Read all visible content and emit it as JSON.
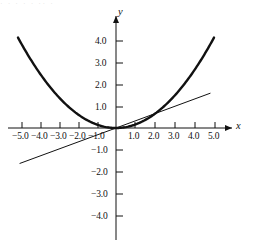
{
  "figure": {
    "background_color": "#ffffff",
    "stroke_color": "#111111",
    "top_artifact_text": "· ·   · ·  ·   ·· ·"
  },
  "chart_data": {
    "type": "line",
    "title": "",
    "subtitle": "",
    "xlabel": "x",
    "ylabel": "y",
    "xlim": [
      -5.6,
      5.9
    ],
    "ylim": [
      -4.8,
      4.6
    ],
    "grid": false,
    "legend": null,
    "axes_style": "cartesian-cross",
    "x_ticks": [
      -5,
      -4,
      -3,
      -2,
      -1,
      1,
      2,
      3,
      4,
      5
    ],
    "x_tick_labels": [
      "−5.0",
      "−4.0",
      "−3.0",
      "−2.0",
      "−1.0",
      "1.0",
      "2.0",
      "3.0",
      "4.0",
      "5.0"
    ],
    "y_ticks": [
      4,
      3,
      2,
      1,
      -1,
      -2,
      -3,
      -4
    ],
    "y_tick_labels": [
      "4.0",
      "3.0",
      "2.0",
      "1.0",
      "−1.0",
      "−2.0",
      "−3.0",
      "−4.0"
    ],
    "series": [
      {
        "name": "parabola",
        "equation": "y = x^2 / 6",
        "style": "thick-solid",
        "stroke_width": 2.4,
        "color": "#111111",
        "x_range": [
          -5.0,
          5.0
        ],
        "x": [
          -5.0,
          -4.5,
          -4.0,
          -3.5,
          -3.0,
          -2.5,
          -2.0,
          -1.5,
          -1.0,
          -0.5,
          0.0,
          0.5,
          1.0,
          1.5,
          2.0,
          2.5,
          3.0,
          3.5,
          4.0,
          4.5,
          5.0
        ],
        "y": [
          4.17,
          3.38,
          2.67,
          2.04,
          1.5,
          1.04,
          0.67,
          0.38,
          0.17,
          0.04,
          0.0,
          0.04,
          0.17,
          0.38,
          0.67,
          1.04,
          1.5,
          2.04,
          2.67,
          3.38,
          4.17
        ]
      },
      {
        "name": "line",
        "equation": "y = x / 3",
        "style": "thin-solid",
        "stroke_width": 1.0,
        "color": "#111111",
        "x_range": [
          -4.9,
          4.8
        ],
        "x": [
          -4.9,
          0.0,
          4.8
        ],
        "y": [
          -1.63,
          0.0,
          1.6
        ]
      }
    ]
  },
  "axis_labels": {
    "x": "x",
    "y": "y"
  }
}
